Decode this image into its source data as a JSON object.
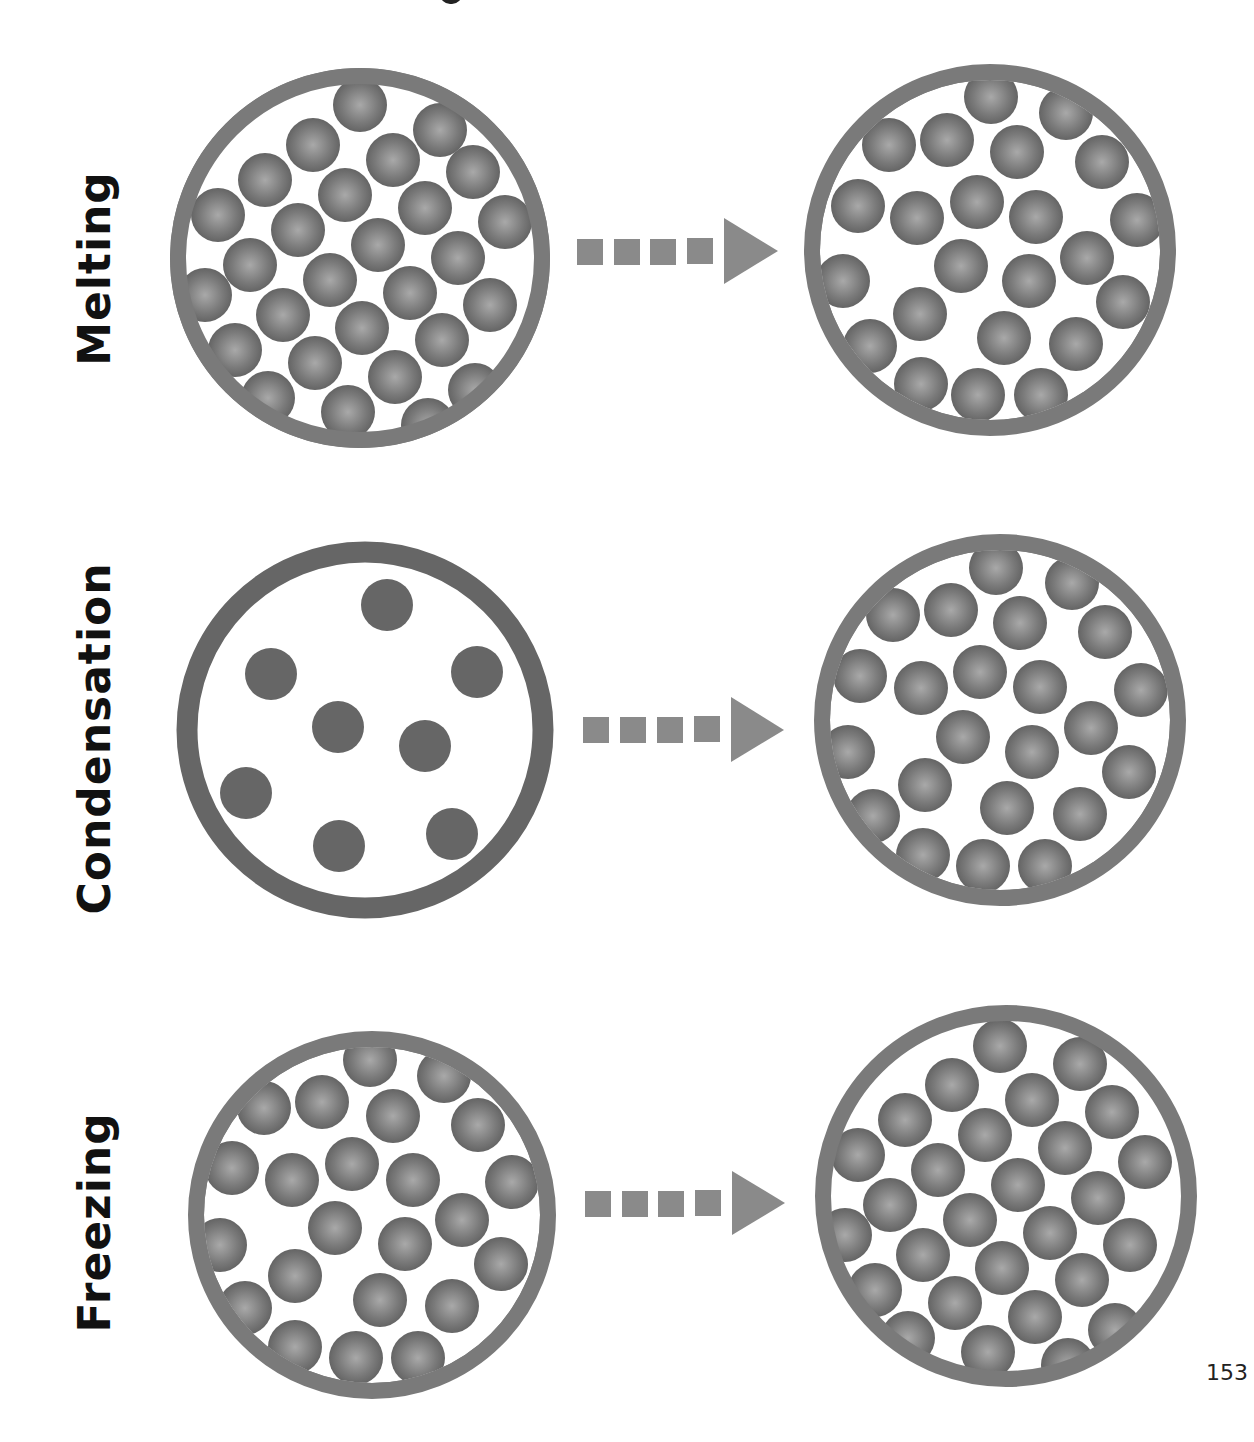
{
  "page": {
    "page_number": "153",
    "colors": {
      "container_ring": "#7a7a7a",
      "gas_ring": "#666666",
      "particle": "#6a6a6a",
      "particle_highlight": "#a8a8a8",
      "arrow": "#8a8a8a",
      "label_text": "#111111"
    }
  },
  "rows": [
    {
      "label": "Melting",
      "from_state": "solid",
      "to_state": "liquid",
      "arrow": "dashed-right-arrow"
    },
    {
      "label": "Condensation",
      "from_state": "gas",
      "to_state": "liquid",
      "arrow": "dashed-right-arrow"
    },
    {
      "label": "Freezing",
      "from_state": "liquid",
      "to_state": "solid",
      "arrow": "dashed-right-arrow"
    }
  ]
}
